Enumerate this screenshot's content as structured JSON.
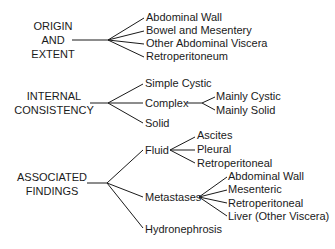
{
  "diagram": {
    "type": "tree",
    "groups": [
      {
        "label_lines": [
          "ORIGIN",
          "AND",
          "EXTENT"
        ],
        "children": [
          {
            "label": "Abdominal Wall"
          },
          {
            "label": "Bowel and Mesentery"
          },
          {
            "label": "Other Abdominal Viscera"
          },
          {
            "label": "Retroperitoneum"
          }
        ]
      },
      {
        "label_lines": [
          "INTERNAL",
          "CONSISTENCY"
        ],
        "children": [
          {
            "label": "Simple Cystic"
          },
          {
            "label": "Complex",
            "children": [
              {
                "label": "Mainly Cystic"
              },
              {
                "label": "Mainly Solid"
              }
            ]
          },
          {
            "label": "Solid"
          }
        ]
      },
      {
        "label_lines": [
          "ASSOCIATED",
          "FINDINGS"
        ],
        "children": [
          {
            "label": "Fluid",
            "children": [
              {
                "label": "Ascites"
              },
              {
                "label": "Pleural"
              },
              {
                "label": "Retroperitoneal"
              }
            ]
          },
          {
            "label": "Metastases",
            "children": [
              {
                "label": "Abdominal Wall"
              },
              {
                "label": "Mesenteric"
              },
              {
                "label": "Retroperitoneal"
              },
              {
                "label": "Liver (Other Viscera)"
              }
            ]
          },
          {
            "label": "Hydronephrosis"
          }
        ]
      }
    ],
    "line_color": "#1a1a1a"
  }
}
